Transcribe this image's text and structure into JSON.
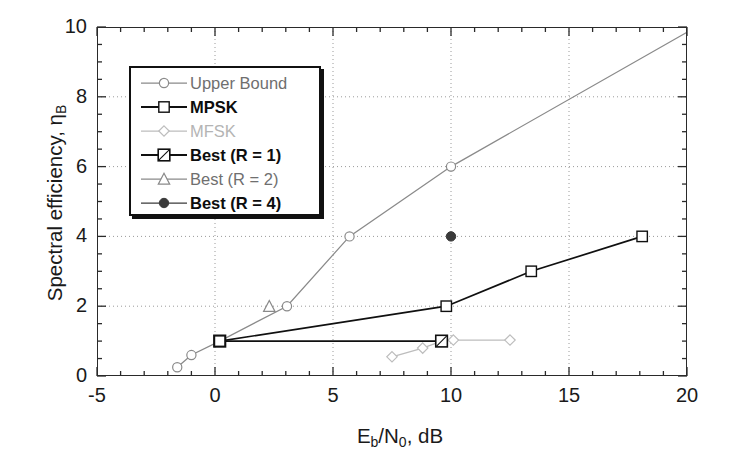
{
  "figure": {
    "background": "#ffffff"
  },
  "axes": {
    "x_title_main": "E",
    "x_title_sub1": "b",
    "x_title_mid": "/N",
    "x_title_sub2": "0",
    "x_title_tail": ", dB",
    "x_title_plain": "Eb/N0, dB",
    "y_title_main": "Spectral efficiency, η",
    "y_title_sub": "B",
    "y_title_plain": "Spectral efficiency, ηB",
    "x_ticks": [
      "-5",
      "0",
      "5",
      "10",
      "15",
      "20"
    ],
    "y_ticks": [
      "0",
      "2",
      "4",
      "6",
      "8",
      "10"
    ]
  },
  "legend": {
    "position": "upper-left-inside",
    "items": [
      {
        "label": "Upper Bound",
        "marker": "circle-open",
        "color": "#8a8a8a",
        "tone": "lt-mid"
      },
      {
        "label": "MPSK",
        "marker": "square-open",
        "color": "#101010",
        "tone": "lt-dark"
      },
      {
        "label": "MFSK",
        "marker": "diamond-open",
        "color": "#bdbdbd",
        "tone": "lt-light"
      },
      {
        "label": "Best (R = 1)",
        "marker": "square-slashed",
        "color": "#101010",
        "tone": "lt-dark"
      },
      {
        "label": "Best (R = 2)",
        "marker": "triangle-open",
        "color": "#8a8a8a",
        "tone": "lt-mid"
      },
      {
        "label": "Best (R = 4)",
        "marker": "circle-filled",
        "color": "#3a3a3a",
        "tone": "lt-dark"
      }
    ]
  },
  "chart_data": {
    "type": "line",
    "title": "",
    "xlabel": "Eb/N0, dB",
    "ylabel": "Spectral efficiency, ηB",
    "xlim": [
      -5,
      20
    ],
    "ylim": [
      0,
      10
    ],
    "x_major_step": 5,
    "x_minor_step": 1,
    "y_major_step": 2,
    "y_minor_step": 0.5,
    "grid": "dotted major gridlines, both axes",
    "legend_position": "upper left inside axes",
    "series": [
      {
        "name": "Upper Bound",
        "marker": "circle-open",
        "color": "#8a8a8a",
        "points": [
          [
            -1.6,
            0.25
          ],
          [
            -1.0,
            0.6
          ],
          [
            0.2,
            1.0
          ],
          [
            3.05,
            2.0
          ],
          [
            5.7,
            4.0
          ],
          [
            10.0,
            6.0
          ],
          [
            20.0,
            9.85
          ]
        ]
      },
      {
        "name": "MPSK",
        "marker": "square-open",
        "color": "#101010",
        "points": [
          [
            0.2,
            1.0
          ],
          [
            9.8,
            2.0
          ],
          [
            13.4,
            3.0
          ],
          [
            18.1,
            4.0
          ]
        ]
      },
      {
        "name": "MFSK",
        "marker": "diamond-open",
        "color": "#bdbdbd",
        "points": [
          [
            7.5,
            0.55
          ],
          [
            8.8,
            0.8
          ],
          [
            9.6,
            1.0
          ],
          [
            10.1,
            1.03
          ],
          [
            12.5,
            1.03
          ]
        ]
      },
      {
        "name": "Best (R = 1)",
        "marker": "square-slashed",
        "color": "#101010",
        "points": [
          [
            0.2,
            1.0
          ],
          [
            9.6,
            1.0
          ]
        ]
      },
      {
        "name": "Best (R = 2)",
        "marker": "triangle-open",
        "color": "#8a8a8a",
        "points": [
          [
            2.3,
            2.0
          ]
        ]
      },
      {
        "name": "Best (R = 4)",
        "marker": "circle-filled",
        "color": "#3a3a3a",
        "points": [
          [
            10.0,
            4.0
          ]
        ]
      }
    ]
  }
}
